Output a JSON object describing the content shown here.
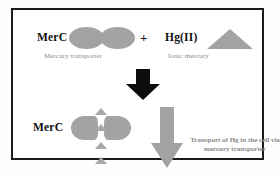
{
  "figure": {
    "frame_border_color": "#1a1a1a",
    "background_color": "#ffffff"
  },
  "top_row": {
    "merc_label": "MerC",
    "merc_caption": "Mercury transporter",
    "operator": "+",
    "hg_label": "Hg(II)",
    "hg_caption": "Ionic mercury",
    "shape_color": "#a3a3a3"
  },
  "reaction_arrow": {
    "name": "downward-reaction-arrow",
    "direction": "down",
    "color": "#0d0d0d"
  },
  "bottom_row": {
    "merc_label": "MerC",
    "transport_caption": "Transport of Hg in the cell via mercury transporter",
    "transport_arrow_color": "#a3a3a3",
    "ion_count": 4,
    "shape_color": "#a3a3a3"
  }
}
